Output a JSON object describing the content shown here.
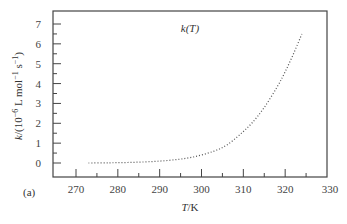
{
  "chart_data": {
    "type": "line",
    "title": "k(T)",
    "panel_label": "(a)",
    "xlabel": "T/K",
    "ylabel": "k/(10^-6 L mol^-1 s^-1)",
    "xlim": [
      265,
      330
    ],
    "ylim": [
      -0.5,
      7.5
    ],
    "x_ticks": [
      270,
      280,
      290,
      300,
      310,
      320,
      330
    ],
    "y_ticks": [
      0,
      1,
      2,
      3,
      4,
      5,
      6,
      7
    ],
    "grid": false,
    "legend": null,
    "series": [
      {
        "name": "k(T)",
        "style": "dotted",
        "color": "#555555",
        "x": [
          273,
          278,
          283,
          288,
          293,
          298,
          303,
          306,
          309,
          312,
          315,
          318,
          320,
          322,
          324
        ],
        "y": [
          0.0,
          0.01,
          0.03,
          0.07,
          0.15,
          0.3,
          0.6,
          0.9,
          1.4,
          2.0,
          2.8,
          3.8,
          4.6,
          5.5,
          6.5
        ]
      }
    ]
  },
  "labels": {
    "title": "k(T)",
    "xlabel": "T/K",
    "panel": "(a)"
  }
}
